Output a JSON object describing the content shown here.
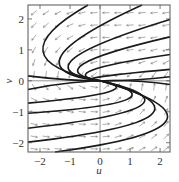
{
  "chart_data": {
    "type": "line",
    "subtype": "phase-portrait-with-direction-field",
    "title": "",
    "xlabel": "u",
    "ylabel": "v",
    "xlim": [
      -2.4,
      2.33
    ],
    "ylim": [
      -2.3,
      2.45
    ],
    "xticks": [
      -2,
      -1,
      0,
      1,
      2
    ],
    "yticks": [
      -2,
      -1,
      0,
      1,
      2
    ],
    "xtick_labels": [
      "−2",
      "−1",
      "0",
      "1",
      "2"
    ],
    "ytick_labels": [
      "−2",
      "−1",
      "0",
      "1",
      "2"
    ],
    "grid": false,
    "reference_lines": [
      {
        "axis": "u",
        "value": 0
      },
      {
        "axis": "v",
        "value": 0
      }
    ],
    "direction_field": {
      "description": "small arrows: down-left in upper-left, left in upper-right, right in lower-left, up-right in lower-right",
      "u_range": [
        -2.2,
        2.2
      ],
      "v_range": [
        -2.2,
        2.2
      ],
      "step": 0.4
    },
    "trajectories": [
      {
        "name": "upper-1",
        "points": [
          [
            -0.4,
            2.45
          ],
          [
            -1.9,
            0.95
          ],
          [
            0,
            0
          ]
        ]
      },
      {
        "name": "upper-2",
        "points": [
          [
            1.4,
            2.45
          ],
          [
            -1.3,
            0.8
          ],
          [
            0,
            0
          ]
        ]
      },
      {
        "name": "upper-3",
        "points": [
          [
            2.33,
            1.98
          ],
          [
            -0.9,
            0.7
          ],
          [
            0,
            0
          ]
        ]
      },
      {
        "name": "upper-4",
        "points": [
          [
            2.33,
            1.42
          ],
          [
            -0.55,
            0.55
          ],
          [
            0,
            0
          ]
        ]
      },
      {
        "name": "upper-5",
        "points": [
          [
            2.33,
            0.85
          ],
          [
            -0.25,
            0.35
          ],
          [
            0,
            0
          ]
        ]
      },
      {
        "name": "upper-6",
        "points": [
          [
            2.33,
            0.37
          ],
          [
            -0.05,
            0.12
          ],
          [
            0,
            0
          ]
        ]
      },
      {
        "name": "near-axis-upper",
        "points": [
          [
            -2.4,
            0.16
          ],
          [
            0,
            0
          ],
          [
            2.33,
            0.13
          ]
        ]
      },
      {
        "name": "near-axis-lower",
        "points": [
          [
            -2.4,
            -0.28
          ],
          [
            0,
            0
          ],
          [
            2.33,
            -0.12
          ]
        ]
      },
      {
        "name": "lower-1",
        "points": [
          [
            -2.4,
            -0.72
          ],
          [
            0.3,
            -0.35
          ],
          [
            0,
            0
          ]
        ]
      },
      {
        "name": "lower-2",
        "points": [
          [
            -2.4,
            -1.05
          ],
          [
            0.9,
            -0.6
          ],
          [
            0,
            0
          ]
        ]
      },
      {
        "name": "lower-3",
        "points": [
          [
            -2.4,
            -1.53
          ],
          [
            1.35,
            -0.8
          ],
          [
            0,
            0
          ]
        ]
      },
      {
        "name": "lower-4",
        "points": [
          [
            -2.4,
            -1.98
          ],
          [
            1.7,
            -1.1
          ],
          [
            0,
            0
          ]
        ]
      },
      {
        "name": "lower-5",
        "points": [
          [
            -1.5,
            -2.3
          ],
          [
            2.2,
            -1.3
          ],
          [
            0,
            0
          ]
        ]
      }
    ]
  },
  "axes": {
    "xlabel": "u",
    "ylabel": "v",
    "xticks": [
      {
        "value": -2,
        "label": "−2"
      },
      {
        "value": -1,
        "label": "−1"
      },
      {
        "value": 0,
        "label": "0"
      },
      {
        "value": 1,
        "label": "1"
      },
      {
        "value": 2,
        "label": "2"
      }
    ],
    "yticks": [
      {
        "value": 2,
        "label": "2"
      },
      {
        "value": 1,
        "label": "1"
      },
      {
        "value": 0,
        "label": "0"
      },
      {
        "value": -1,
        "label": "−1"
      },
      {
        "value": -2,
        "label": "−2"
      }
    ]
  },
  "colors": {
    "curve": "#1a1a1a",
    "arrow": "#8a8a8a",
    "frame": "#555555"
  }
}
